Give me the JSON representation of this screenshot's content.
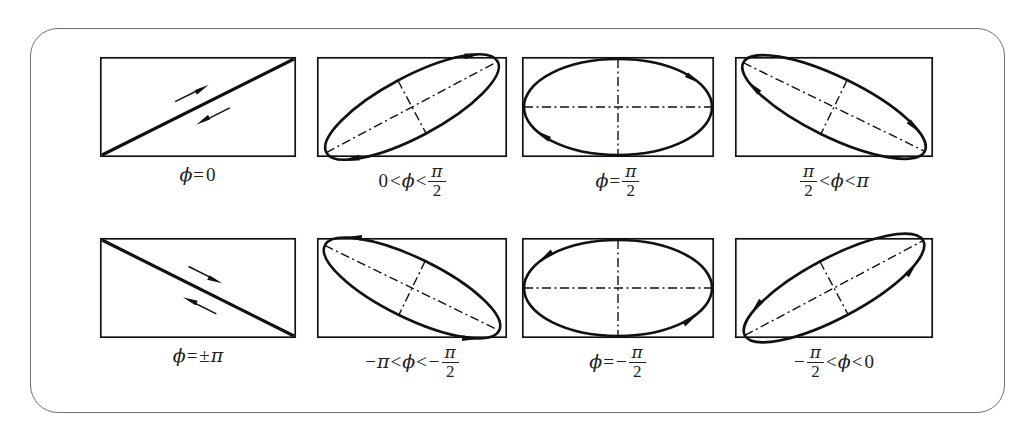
{
  "figure": {
    "frame": {
      "rounded": true,
      "border_color": "#6e6e6e"
    },
    "symbol": "ϕ",
    "pi": "π",
    "panels": [
      {
        "id": "phi-0",
        "row": 0,
        "col": 0,
        "shape": "line",
        "line_direction": "diagonal-up",
        "rotation_sense": "linear",
        "arrows": [
          "up-right",
          "down-left"
        ],
        "caption_parts": [
          {
            "type": "sym",
            "text": "ϕ"
          },
          {
            "type": "op",
            "text": "="
          },
          {
            "type": "num",
            "text": "0"
          }
        ]
      },
      {
        "id": "phi-0-to-pi-over-2",
        "row": 0,
        "col": 1,
        "shape": "ellipse",
        "tilt_deg": -28,
        "rotation_sense": "counterclockwise",
        "axes": "tilted",
        "caption_parts": [
          {
            "type": "num",
            "text": "0"
          },
          {
            "type": "op",
            "text": "<"
          },
          {
            "type": "sym",
            "text": "ϕ"
          },
          {
            "type": "op",
            "text": "<"
          },
          {
            "type": "frac",
            "num": "π",
            "den": "2"
          }
        ]
      },
      {
        "id": "phi-eq-pi-over-2",
        "row": 0,
        "col": 2,
        "shape": "ellipse",
        "tilt_deg": 0,
        "rotation_sense": "counterclockwise",
        "axes": "upright",
        "caption_parts": [
          {
            "type": "sym",
            "text": "ϕ"
          },
          {
            "type": "op",
            "text": "="
          },
          {
            "type": "frac",
            "num": "π",
            "den": "2"
          }
        ]
      },
      {
        "id": "phi-pi-over-2-to-pi",
        "row": 0,
        "col": 3,
        "shape": "ellipse",
        "tilt_deg": 26,
        "rotation_sense": "counterclockwise",
        "axes": "tilted",
        "caption_parts": [
          {
            "type": "frac",
            "num": "π",
            "den": "2"
          },
          {
            "type": "op",
            "text": "<"
          },
          {
            "type": "sym",
            "text": "ϕ"
          },
          {
            "type": "op",
            "text": "<"
          },
          {
            "type": "sym",
            "text": "π"
          }
        ]
      },
      {
        "id": "phi-eq-plus-minus-pi",
        "row": 1,
        "col": 0,
        "shape": "line",
        "line_direction": "diagonal-down",
        "rotation_sense": "linear",
        "arrows": [
          "up-left",
          "down-right"
        ],
        "caption_parts": [
          {
            "type": "sym",
            "text": "ϕ"
          },
          {
            "type": "op",
            "text": "="
          },
          {
            "type": "num",
            "text": "±"
          },
          {
            "type": "sym",
            "text": "π"
          }
        ]
      },
      {
        "id": "phi-minus-pi-to-minus-pi-over-2",
        "row": 1,
        "col": 1,
        "shape": "ellipse",
        "tilt_deg": 26,
        "rotation_sense": "clockwise",
        "axes": "tilted",
        "caption_parts": [
          {
            "type": "num",
            "text": "−"
          },
          {
            "type": "sym",
            "text": "π"
          },
          {
            "type": "op",
            "text": "<"
          },
          {
            "type": "sym",
            "text": "ϕ"
          },
          {
            "type": "op",
            "text": "<"
          },
          {
            "type": "num",
            "text": "−"
          },
          {
            "type": "frac",
            "num": "π",
            "den": "2"
          }
        ]
      },
      {
        "id": "phi-eq-minus-pi-over-2",
        "row": 1,
        "col": 2,
        "shape": "ellipse",
        "tilt_deg": 0,
        "rotation_sense": "clockwise",
        "axes": "upright",
        "caption_parts": [
          {
            "type": "sym",
            "text": "ϕ"
          },
          {
            "type": "op",
            "text": "="
          },
          {
            "type": "num",
            "text": "−"
          },
          {
            "type": "frac",
            "num": "π",
            "den": "2"
          }
        ]
      },
      {
        "id": "phi-minus-pi-over-2-to-0",
        "row": 1,
        "col": 3,
        "shape": "ellipse",
        "tilt_deg": -28,
        "rotation_sense": "clockwise",
        "axes": "tilted",
        "caption_parts": [
          {
            "type": "num",
            "text": "−"
          },
          {
            "type": "frac",
            "num": "π",
            "den": "2"
          },
          {
            "type": "op",
            "text": "<"
          },
          {
            "type": "sym",
            "text": "ϕ"
          },
          {
            "type": "op",
            "text": "<"
          },
          {
            "type": "num",
            "text": "0"
          }
        ]
      }
    ]
  }
}
